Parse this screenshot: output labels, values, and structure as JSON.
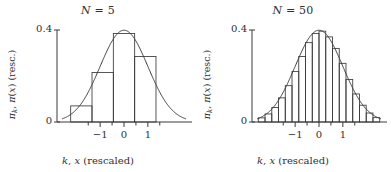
{
  "figure": {
    "background": "#ffffff",
    "ink": "#3a3a3a",
    "width": 391,
    "height": 172
  },
  "panels": [
    {
      "id": "panel-n5",
      "title_var": "N",
      "title_op": " = ",
      "title_value": "5",
      "title": "N = 5",
      "xlabel": "k, x (rescaled)",
      "xlabel_sym1": "k",
      "xlabel_sep": ", ",
      "xlabel_sym2": "x",
      "xlabel_rest": " (rescaled)",
      "ylabel": "πk, π(x) (resc.)",
      "ytick_labels": [
        "0.4",
        "0"
      ],
      "xtick_labels": [
        "−1",
        "0",
        "1"
      ]
    },
    {
      "id": "panel-n50",
      "title_var": "N",
      "title_op": " = ",
      "title_value": "50",
      "title": "N = 50",
      "xlabel": "k, x (rescaled)",
      "xlabel_sym1": "k",
      "xlabel_sep": ", ",
      "xlabel_sym2": "x",
      "xlabel_rest": " (rescaled)",
      "ylabel": "πk, π(x) (resc.)",
      "ytick_labels": [
        "0.4",
        "0"
      ],
      "xtick_labels": [
        "−1",
        "0",
        "1"
      ]
    }
  ],
  "chart_data": [
    {
      "type": "bar",
      "id": "panel-n5",
      "title": "N = 5",
      "xlabel": "k, x (rescaled)",
      "ylabel": "πk, π(x) (resc.)",
      "xlim": [
        -2.6,
        2.6
      ],
      "ylim": [
        0,
        0.42
      ],
      "yticks": [
        0,
        0.4
      ],
      "ytick_labels": [
        "0",
        "0.4"
      ],
      "xticks": [
        -1.5,
        -1,
        -0.5,
        0,
        0.5,
        1,
        1.5
      ],
      "labeled_xticks": [
        -1,
        0,
        1
      ],
      "xtick_labels": [
        "−1",
        "0",
        "1"
      ],
      "grid": false,
      "legend": "none",
      "bar_width": 0.894,
      "categories": [
        -1.789,
        -0.894,
        0.0,
        0.894
      ],
      "values": [
        0.07,
        0.215,
        0.385,
        0.285
      ],
      "overlay_curve": {
        "name": "gaussian",
        "mean": 0.0,
        "sigma": 1.0,
        "peak": 0.399,
        "x": [
          -2.6,
          -2.4,
          -2.2,
          -2.0,
          -1.8,
          -1.6,
          -1.4,
          -1.2,
          -1.0,
          -0.8,
          -0.6,
          -0.4,
          -0.2,
          0.0,
          0.2,
          0.4,
          0.6,
          0.8,
          1.0,
          1.2,
          1.4,
          1.6,
          1.8,
          2.0,
          2.2,
          2.4,
          2.6
        ],
        "y": [
          0.0136,
          0.0224,
          0.0355,
          0.054,
          0.079,
          0.1109,
          0.1497,
          0.1942,
          0.242,
          0.2897,
          0.3332,
          0.3683,
          0.391,
          0.3989,
          0.391,
          0.3683,
          0.3332,
          0.2897,
          0.242,
          0.1942,
          0.1497,
          0.1109,
          0.079,
          0.054,
          0.0355,
          0.0224,
          0.0136
        ]
      }
    },
    {
      "type": "bar",
      "id": "panel-n50",
      "title": "N = 50",
      "xlabel": "k, x (rescaled)",
      "ylabel": "πk, π(x) (resc.)",
      "xlim": [
        -2.6,
        2.6
      ],
      "ylim": [
        0,
        0.42
      ],
      "yticks": [
        0,
        0.4
      ],
      "ytick_labels": [
        "0",
        "0.4"
      ],
      "xticks": [
        -1.5,
        -1,
        -0.5,
        0,
        0.5,
        1,
        1.5
      ],
      "labeled_xticks": [
        -1,
        0,
        1
      ],
      "xtick_labels": [
        "−1",
        "0",
        "1"
      ],
      "grid": false,
      "legend": "none",
      "bar_width": 0.283,
      "categories": [
        -2.404,
        -2.121,
        -1.838,
        -1.556,
        -1.273,
        -0.99,
        -0.707,
        -0.424,
        -0.141,
        0.141,
        0.424,
        0.707,
        0.99,
        1.273,
        1.556,
        1.838,
        2.121,
        2.404
      ],
      "values": [
        0.018,
        0.035,
        0.063,
        0.105,
        0.158,
        0.22,
        0.285,
        0.345,
        0.385,
        0.395,
        0.37,
        0.32,
        0.255,
        0.185,
        0.122,
        0.073,
        0.039,
        0.019
      ],
      "overlay_curve": {
        "name": "gaussian",
        "mean": 0.0,
        "sigma": 1.0,
        "peak": 0.399,
        "x": [
          -2.6,
          -2.4,
          -2.2,
          -2.0,
          -1.8,
          -1.6,
          -1.4,
          -1.2,
          -1.0,
          -0.8,
          -0.6,
          -0.4,
          -0.2,
          0.0,
          0.2,
          0.4,
          0.6,
          0.8,
          1.0,
          1.2,
          1.4,
          1.6,
          1.8,
          2.0,
          2.2,
          2.4,
          2.6
        ],
        "y": [
          0.0136,
          0.0224,
          0.0355,
          0.054,
          0.079,
          0.1109,
          0.1497,
          0.1942,
          0.242,
          0.2897,
          0.3332,
          0.3683,
          0.391,
          0.3989,
          0.391,
          0.3683,
          0.3332,
          0.2897,
          0.242,
          0.1942,
          0.1497,
          0.1109,
          0.079,
          0.054,
          0.0355,
          0.0224,
          0.0136
        ]
      }
    }
  ]
}
